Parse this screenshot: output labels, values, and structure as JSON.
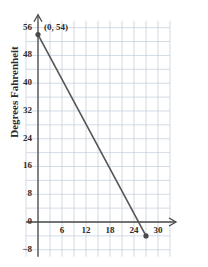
{
  "chart_data": {
    "type": "line",
    "title": "",
    "subtitle": "",
    "xlabel": "",
    "ylabel": "Degrees Fahrenheit",
    "xlim": [
      -3,
      33
    ],
    "ylim": [
      -10,
      58
    ],
    "x_tick_labels": [
      "6",
      "12",
      "18",
      "24",
      "30"
    ],
    "x_tick_values": [
      6,
      12,
      18,
      24,
      30
    ],
    "y_tick_labels": [
      "56",
      "48",
      "40",
      "32",
      "24",
      "16",
      "8",
      "0",
      "-8"
    ],
    "y_tick_values": [
      56,
      48,
      40,
      32,
      24,
      16,
      8,
      0,
      -8
    ],
    "x_major_step": 6,
    "x_grid_step": 3,
    "y_major_step": 8,
    "y_grid_step": 4,
    "grid": true,
    "legend": "none",
    "x_axis_arrow": true,
    "y_axis_arrow": true,
    "series": [
      {
        "name": "temperature",
        "x": [
          0,
          27
        ],
        "values": [
          54,
          -4
        ],
        "endpoints_marked": [
          true,
          true
        ],
        "x_intercept": 25
      }
    ],
    "annotations": [
      {
        "text": "(0, 54)",
        "x": 0,
        "y": 54
      }
    ],
    "colors": {
      "line": "#555555",
      "point": "#4a4a4a",
      "grid": "#c8d2e0",
      "axis": "#4a4a4a",
      "text": "#2b2b2b",
      "background": "#ffffff"
    }
  }
}
